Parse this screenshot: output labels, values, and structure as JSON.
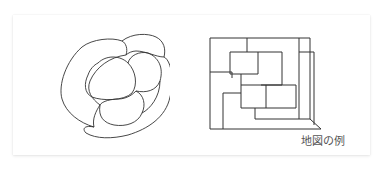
{
  "heading": {
    "text": "",
    "clipped": true
  },
  "card": {
    "caption": "地図の例",
    "figures": [
      {
        "name": "region-map",
        "kind": "freeform-blobs",
        "region_count": 6
      },
      {
        "name": "grid-map",
        "kind": "rectilinear-regions",
        "region_count": 9
      }
    ]
  },
  "colors": {
    "stroke": "#333333",
    "caption": "#555555",
    "card_bg": "#ffffff",
    "shadow": "#e6e6e6"
  }
}
